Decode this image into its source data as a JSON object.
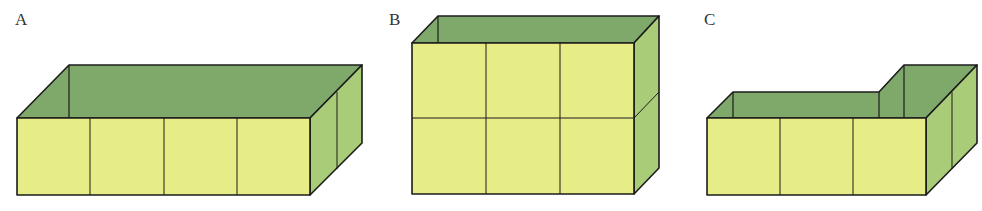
{
  "figures": [
    {
      "label": "A",
      "description": "open box 4 cubes long, 1 deep, 1 high"
    },
    {
      "label": "B",
      "description": "open box 3 cubes long, 1 deep, 2 high"
    },
    {
      "label": "C",
      "description": "L-shaped open box, 3 cubes front, 1 extra at back right"
    }
  ],
  "colors": {
    "front": "#e6ec86",
    "inner": "#7fa96a",
    "side": "#a9cc78",
    "stroke": "#1c1c1c"
  }
}
